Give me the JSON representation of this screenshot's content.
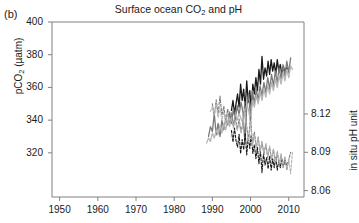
{
  "panel": {
    "label": "(b)"
  },
  "chart_data": {
    "type": "line",
    "title": "Surface ocean CO2 and pH",
    "title_parts": {
      "pre": "Surface ocean CO",
      "sub": "2",
      "post": " and pH"
    },
    "xlabel": "",
    "ylabel_left_parts": {
      "pre": "pCO",
      "sub": "2",
      "post": " (µatm)"
    },
    "ylabel_left": "pCO2 (µatm)",
    "ylabel_right": "in situ pH unit",
    "grid": false,
    "legend": "none",
    "xlim": [
      1948,
      2014
    ],
    "xticks": [
      1950,
      1960,
      1970,
      1980,
      1990,
      2000,
      2010
    ],
    "xtick_labels": [
      "1950",
      "1960",
      "1970",
      "1980",
      "1990",
      "2000",
      "2010"
    ],
    "ylim_left": [
      293,
      400
    ],
    "yticks_left": [
      320,
      340,
      360,
      380,
      400
    ],
    "ytick_labels_left": [
      "320",
      "340",
      "360",
      "380",
      "400"
    ],
    "ylim_right": [
      8.055,
      8.192
    ],
    "yticks_right": [
      8.06,
      8.09,
      8.12
    ],
    "ytick_labels_right": [
      "8.06",
      "8.09",
      "8.12"
    ],
    "colors": {
      "series_black": "#1a1a1a",
      "series_dark_gray": "#7a7a7a",
      "series_light_gray": "#b5b5b5",
      "axis": "#808080",
      "text": "#1a1a1a"
    },
    "series": [
      {
        "name": "pCO2 station A (black, solid)",
        "axis": "left",
        "color": "#1a1a1a",
        "style": "solid",
        "x": [
          1995.0,
          1995.4,
          1995.8,
          1996.2,
          1996.6,
          1997.0,
          1997.4,
          1997.8,
          1998.2,
          1998.6,
          1999.0,
          1999.4,
          1999.8,
          2000.2,
          2000.6,
          2001.0,
          2001.4,
          2001.8,
          2002.2,
          2002.6,
          2003.0,
          2003.4,
          2003.8,
          2004.2,
          2004.6,
          2005.0,
          2005.4,
          2005.8,
          2006.2,
          2006.6,
          2007.0,
          2007.4,
          2007.8,
          2008.2,
          2008.6,
          2009.0,
          2009.4,
          2009.8
        ],
        "y": [
          346,
          352,
          344,
          350,
          356,
          348,
          362,
          352,
          359,
          347,
          364,
          351,
          358,
          347,
          362,
          356,
          366,
          358,
          371,
          362,
          379,
          365,
          372,
          367,
          376,
          368,
          377,
          370,
          375,
          368,
          377,
          370,
          374,
          368,
          373,
          369,
          372,
          371
        ]
      },
      {
        "name": "pCO2 station B (dark gray, solid)",
        "axis": "left",
        "color": "#7a7a7a",
        "style": "solid",
        "x": [
          1989.0,
          1989.5,
          1990.0,
          1990.5,
          1991.0,
          1991.5,
          1992.0,
          1992.5,
          1993.0,
          1993.5,
          1994.0,
          1994.5,
          1995.0,
          1995.5,
          1996.0,
          1996.5,
          1997.0,
          1997.5,
          1998.0,
          1998.5,
          1999.0,
          1999.5,
          2000.0,
          2000.5,
          2001.0,
          2001.5,
          2002.0,
          2002.5,
          2003.0,
          2003.5,
          2004.0,
          2004.5,
          2005.0,
          2005.5,
          2006.0,
          2006.5,
          2007.0,
          2007.5,
          2008.0,
          2008.5,
          2009.0,
          2009.5,
          2010.0,
          2010.5
        ],
        "y": [
          330,
          336,
          333,
          344,
          331,
          338,
          330,
          340,
          334,
          341,
          337,
          345,
          338,
          347,
          340,
          349,
          343,
          351,
          345,
          327,
          348,
          356,
          341,
          358,
          350,
          359,
          352,
          361,
          355,
          363,
          357,
          366,
          359,
          368,
          361,
          370,
          363,
          372,
          365,
          374,
          367,
          376,
          369,
          378
        ]
      },
      {
        "name": "pCO2 station C (light gray, solid)",
        "axis": "left",
        "color": "#b5b5b5",
        "style": "solid",
        "x": [
          1988.5,
          1989.0,
          1989.5,
          1990.0,
          1990.5,
          1991.0,
          1991.5,
          1992.0,
          1992.5,
          1993.0,
          1993.5,
          1994.0,
          1994.5,
          1995.0,
          1995.5,
          1996.0,
          1996.5,
          1997.0,
          1997.5,
          1998.0,
          1998.5,
          1999.0,
          1999.5,
          2000.0,
          2000.5,
          2001.0,
          2001.5,
          2002.0,
          2002.5,
          2003.0,
          2003.5,
          2004.0,
          2004.5,
          2005.0,
          2005.5,
          2006.0,
          2006.5,
          2007.0,
          2007.5,
          2008.0,
          2008.5,
          2009.0,
          2009.5,
          2010.0,
          2010.5,
          2011.0
        ],
        "y": [
          326,
          329,
          327,
          332,
          329,
          334,
          331,
          337,
          332,
          338,
          334,
          340,
          336,
          342,
          338,
          343,
          340,
          344,
          341,
          338,
          344,
          350,
          346,
          339,
          352,
          348,
          355,
          350,
          357,
          352,
          359,
          354,
          361,
          356,
          363,
          358,
          365,
          360,
          367,
          362,
          369,
          364,
          371,
          366,
          373,
          371
        ]
      },
      {
        "name": "pH station A (black, dashed)",
        "axis": "right",
        "color": "#1a1a1a",
        "style": "dashed",
        "x": [
          1995.0,
          1995.4,
          1995.8,
          1996.2,
          1996.6,
          1997.0,
          1997.4,
          1997.8,
          1998.2,
          1998.6,
          1999.0,
          1999.4,
          1999.8,
          2000.2,
          2000.6,
          2001.0,
          2001.4,
          2001.8,
          2002.2,
          2002.6,
          2003.0,
          2003.4,
          2003.8,
          2004.2,
          2004.6,
          2005.0,
          2005.4,
          2005.8,
          2006.2,
          2006.6,
          2007.0,
          2007.4,
          2007.8,
          2008.2,
          2008.6,
          2009.0,
          2009.4,
          2009.8
        ],
        "y": [
          8.107,
          8.098,
          8.109,
          8.099,
          8.094,
          8.104,
          8.089,
          8.1,
          8.092,
          8.105,
          8.088,
          8.102,
          8.093,
          8.104,
          8.089,
          8.096,
          8.085,
          8.094,
          8.081,
          8.091,
          8.074,
          8.089,
          8.08,
          8.086,
          8.077,
          8.087,
          8.076,
          8.085,
          8.078,
          8.086,
          8.076,
          8.084,
          8.078,
          8.085,
          8.079,
          8.084,
          8.08,
          8.082
        ]
      },
      {
        "name": "pH station B (dark gray, dashed)",
        "axis": "right",
        "color": "#7a7a7a",
        "style": "dashed",
        "x": [
          1990.0,
          1990.5,
          1991.0,
          1991.5,
          1992.0,
          1992.5,
          1993.0,
          1993.5,
          1994.0,
          1994.5,
          1995.0,
          1995.5,
          1996.0,
          1996.5,
          1997.0,
          1997.5,
          1998.0,
          1998.5,
          1999.0,
          1999.5,
          2000.0,
          2000.5,
          2001.0,
          2001.5,
          2002.0,
          2002.5,
          2003.0,
          2003.5,
          2004.0,
          2004.5,
          2005.0,
          2005.5,
          2006.0,
          2006.5,
          2007.0,
          2007.5,
          2008.0,
          2008.5,
          2009.0,
          2009.5,
          2010.0,
          2010.5
        ],
        "y": [
          8.128,
          8.118,
          8.131,
          8.12,
          8.134,
          8.119,
          8.126,
          8.114,
          8.124,
          8.112,
          8.121,
          8.11,
          8.118,
          8.108,
          8.116,
          8.106,
          8.113,
          8.13,
          8.11,
          8.1,
          8.118,
          8.096,
          8.106,
          8.094,
          8.102,
          8.09,
          8.098,
          8.088,
          8.096,
          8.086,
          8.094,
          8.084,
          8.092,
          8.082,
          8.09,
          8.08,
          8.088,
          8.078,
          8.086,
          8.076,
          8.084,
          8.09
        ]
      },
      {
        "name": "pH station C (light gray, dashed)",
        "axis": "right",
        "color": "#b5b5b5",
        "style": "dashed",
        "x": [
          1989.5,
          1990.0,
          1990.5,
          1991.0,
          1991.5,
          1992.0,
          1992.5,
          1993.0,
          1993.5,
          1994.0,
          1994.5,
          1995.0,
          1995.5,
          1996.0,
          1996.5,
          1997.0,
          1997.5,
          1998.0,
          1998.5,
          1999.0,
          1999.5,
          2000.0,
          2000.5,
          2001.0,
          2001.5,
          2002.0,
          2002.5,
          2003.0,
          2003.5,
          2004.0,
          2004.5,
          2005.0,
          2005.5,
          2006.0,
          2006.5,
          2007.0,
          2007.5,
          2008.0,
          2008.5,
          2009.0,
          2009.5,
          2010.0,
          2010.5,
          2011.0
        ],
        "y": [
          8.122,
          8.126,
          8.119,
          8.128,
          8.117,
          8.125,
          8.115,
          8.122,
          8.113,
          8.12,
          8.111,
          8.117,
          8.109,
          8.115,
          8.107,
          8.113,
          8.105,
          8.111,
          8.124,
          8.108,
          8.098,
          8.114,
          8.095,
          8.104,
          8.093,
          8.101,
          8.091,
          8.099,
          8.089,
          8.097,
          8.087,
          8.095,
          8.085,
          8.093,
          8.083,
          8.091,
          8.081,
          8.089,
          8.079,
          8.087,
          8.077,
          8.085,
          8.073,
          8.091
        ]
      }
    ]
  }
}
